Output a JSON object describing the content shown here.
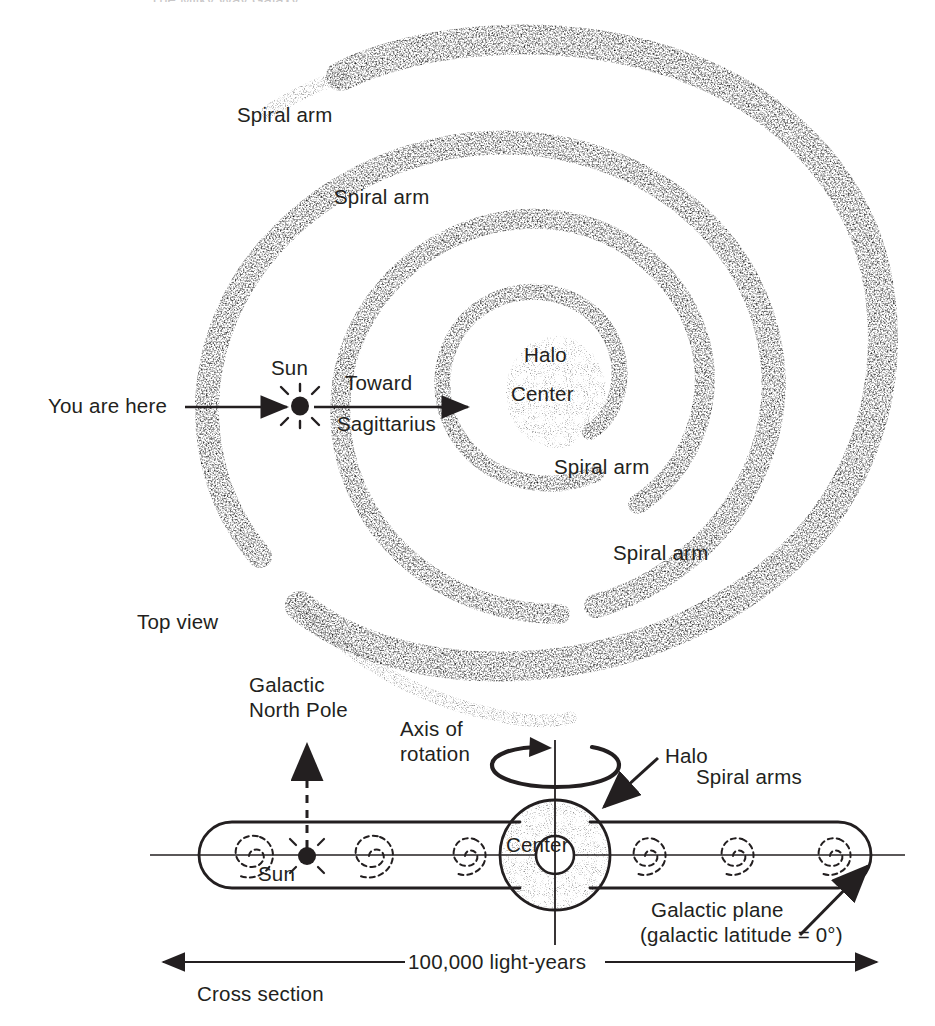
{
  "figure": {
    "title": "The Milky Way Galaxy",
    "background_color": "#ffffff",
    "ink_color": "#231f20",
    "stipple_color": "#3a3637",
    "width": 935,
    "height": 1026
  },
  "top_view": {
    "section_label": "Top view",
    "spiral_arm_labels": [
      {
        "text": "Spiral arm",
        "x": 237,
        "y": 114
      },
      {
        "text": "Spiral arm",
        "x": 334,
        "y": 196
      },
      {
        "text": "Spiral arm",
        "x": 554,
        "y": 466
      },
      {
        "text": "Spiral arm",
        "x": 613,
        "y": 552
      }
    ],
    "core": {
      "halo_label": "Halo",
      "center_label": "Center"
    },
    "sun": {
      "label": "Sun",
      "marker": "sun-star-marker",
      "x": 300,
      "y": 406
    },
    "you_are_here": {
      "label": "You are here",
      "arrow": "arrow-right"
    },
    "toward_sagittarius": {
      "line1": "Toward",
      "line2": "Sagittarius",
      "arrow": "arrow-right"
    }
  },
  "cross_section": {
    "section_label": "Cross section",
    "galactic_north_pole": {
      "line1": "Galactic",
      "line2": "North Pole",
      "arrow": "dashed-arrow-up"
    },
    "axis_of_rotation": {
      "line1": "Axis of",
      "line2": "rotation",
      "arrow": "rotation-ellipse-arrow"
    },
    "halo": {
      "label": "Halo",
      "arrow": "arrow-pointer-down-left"
    },
    "center_label": "Center",
    "spiral_arms_label": "Spiral arms",
    "sun_label": "Sun",
    "galactic_plane": {
      "line1": "Galactic plane",
      "line2": "(galactic latitude = 0°)",
      "arrow": "arrow-up-right"
    },
    "scale": {
      "label": "100,000 light-years",
      "arrow": "double-headed-arrow"
    }
  }
}
